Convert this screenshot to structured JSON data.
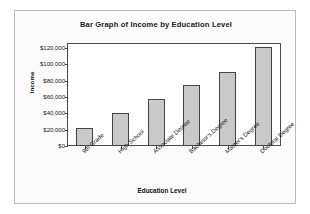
{
  "chart_data": {
    "type": "bar",
    "title": "Bar Graph of Income by Education Level",
    "xlabel": "Education Level",
    "ylabel": "Income",
    "categories": [
      "9th Grade",
      "High School",
      "Associate Degree",
      "Bachelor's Degree",
      "Master's Degree",
      "Doctoral Degree"
    ],
    "values": [
      22000,
      40000,
      57000,
      75000,
      91000,
      121000
    ],
    "ylim": [
      0,
      126000
    ],
    "ytick_values": [
      0,
      20000,
      40000,
      60000,
      80000,
      100000,
      120000
    ],
    "ytick_labels": [
      "$0",
      "$20,000",
      "$40,000",
      "$60,000",
      "$80,000",
      "$100,000",
      "$120,000"
    ],
    "grid": false,
    "legend": false,
    "bar_color": "#c9c9c9",
    "bar_edge_color": "#444444",
    "plot_background": "#ffffff",
    "figure_background": "#fbfbfb"
  }
}
